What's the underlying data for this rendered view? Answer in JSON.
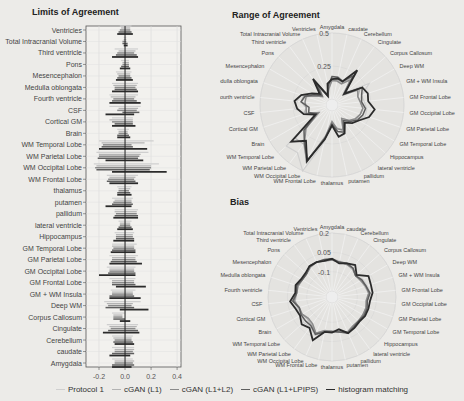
{
  "titles": {
    "loa": "Limits of Agreement",
    "range": "Range of Agreement",
    "bias": "Bias"
  },
  "legend": [
    {
      "label": "Protocol 1",
      "color": "#cfcfcf",
      "width": 1.2
    },
    {
      "label": "cGAN (L1)",
      "color": "#b3b3b3",
      "width": 1.2
    },
    {
      "label": "cGAN (L1+L2)",
      "color": "#8a8a8a",
      "width": 1.5
    },
    {
      "label": "cGAN (L1+LPIPS)",
      "color": "#5e5e5e",
      "width": 1.5
    },
    {
      "label": "histogram matching",
      "color": "#2b2b2b",
      "width": 1.8
    }
  ],
  "chart_data": [
    {
      "type": "bar",
      "subtype": "interval",
      "title": "Limits of Agreement",
      "xlabel": "",
      "ylabel": "",
      "xlim": [
        -0.3,
        0.43
      ],
      "xticks": [
        -0.2,
        0.0,
        0.2,
        0.4
      ],
      "xtick_labels": [
        "-0.2",
        "0.0",
        "0.2",
        "0.4"
      ],
      "grid": true,
      "categories": [
        "Ventricles",
        "Total Intracranial Volume",
        "Third ventricle",
        "Pons",
        "Mesencephalon",
        "Medulla oblongata",
        "Fourth ventricle",
        "CSF",
        "Cortical GM",
        "Brain",
        "WM Temporal Lobe",
        "WM Parietal Lobe",
        "WM Occipital Lobe",
        "WM Frontal Lobe",
        "thalamus",
        "putamen",
        "pallidum",
        "lateral ventricle",
        "Hippocampus",
        "GM Temporal Lobe",
        "GM Parietal Lobe",
        "GM Occipital Lobe",
        "GM Frontal Lobe",
        "GM + WM Insula",
        "Deep WM",
        "Corpus Callosum",
        "Cingulate",
        "Cerebellum",
        "caudate",
        "Amygdala"
      ],
      "series": [
        {
          "name": "Protocol 1",
          "lower": [
            -0.04,
            -0.01,
            -0.08,
            -0.03,
            -0.07,
            -0.1,
            -0.12,
            -0.12,
            -0.1,
            -0.06,
            -0.2,
            -0.22,
            -0.24,
            -0.14,
            -0.06,
            -0.1,
            -0.08,
            -0.05,
            -0.08,
            -0.1,
            -0.12,
            -0.14,
            -0.12,
            -0.11,
            -0.16,
            -0.1,
            -0.14,
            -0.1,
            -0.1,
            -0.1
          ],
          "upper": [
            0.05,
            0.01,
            0.1,
            0.03,
            0.05,
            0.1,
            0.1,
            0.12,
            0.06,
            0.03,
            0.22,
            0.18,
            0.26,
            0.1,
            0.05,
            0.06,
            0.1,
            0.05,
            0.07,
            0.09,
            0.1,
            0.08,
            0.08,
            0.08,
            0.12,
            0.0,
            0.1,
            0.06,
            0.07,
            0.06
          ]
        },
        {
          "name": "cGAN (L1)",
          "lower": [
            -0.03,
            -0.01,
            -0.05,
            -0.02,
            -0.06,
            -0.09,
            -0.11,
            -0.05,
            -0.12,
            -0.05,
            -0.18,
            -0.2,
            -0.22,
            -0.12,
            -0.05,
            -0.08,
            -0.08,
            -0.04,
            -0.07,
            -0.1,
            -0.1,
            -0.12,
            -0.1,
            -0.1,
            -0.14,
            -0.09,
            -0.12,
            -0.09,
            -0.08,
            -0.08
          ],
          "upper": [
            0.04,
            0.01,
            0.08,
            0.03,
            0.04,
            0.09,
            0.08,
            0.1,
            0.06,
            0.02,
            0.15,
            0.12,
            0.2,
            0.08,
            0.04,
            0.05,
            0.09,
            0.04,
            0.06,
            0.07,
            0.08,
            0.07,
            0.07,
            0.06,
            0.06,
            -0.02,
            0.09,
            0.05,
            0.07,
            0.07
          ]
        },
        {
          "name": "cGAN (L1+L2)",
          "lower": [
            -0.04,
            -0.02,
            -0.06,
            -0.02,
            -0.05,
            -0.08,
            -0.09,
            -0.06,
            -0.1,
            -0.05,
            -0.17,
            -0.2,
            -0.23,
            -0.13,
            -0.05,
            -0.09,
            -0.07,
            -0.04,
            -0.07,
            -0.09,
            -0.1,
            -0.12,
            -0.1,
            -0.1,
            -0.13,
            -0.09,
            -0.11,
            -0.08,
            -0.08,
            -0.08
          ],
          "upper": [
            0.04,
            0.01,
            0.07,
            0.03,
            0.04,
            0.08,
            0.07,
            0.09,
            0.06,
            0.02,
            0.05,
            0.11,
            0.2,
            0.07,
            0.03,
            0.05,
            0.09,
            0.04,
            0.06,
            0.07,
            0.08,
            0.07,
            0.07,
            0.06,
            0.05,
            -0.02,
            0.08,
            0.05,
            0.06,
            0.06
          ]
        },
        {
          "name": "cGAN (L1+LPIPS)",
          "lower": [
            -0.05,
            -0.02,
            -0.07,
            -0.03,
            -0.06,
            -0.08,
            -0.1,
            -0.02,
            -0.08,
            -0.06,
            -0.18,
            -0.21,
            -0.22,
            -0.14,
            -0.06,
            -0.1,
            -0.08,
            -0.05,
            -0.07,
            -0.1,
            -0.11,
            -0.13,
            -0.1,
            -0.12,
            -0.15,
            -0.09,
            -0.13,
            -0.09,
            -0.1,
            -0.1
          ],
          "upper": [
            0.05,
            0.02,
            0.09,
            0.03,
            0.05,
            0.09,
            0.09,
            0.11,
            0.06,
            0.03,
            0.06,
            0.1,
            0.19,
            0.08,
            0.04,
            0.06,
            0.1,
            0.05,
            0.07,
            0.08,
            0.09,
            0.08,
            0.08,
            0.07,
            0.07,
            0.0,
            0.1,
            0.06,
            0.07,
            0.07
          ]
        },
        {
          "name": "histogram matching",
          "lower": [
            -0.06,
            -0.01,
            -0.1,
            -0.04,
            -0.07,
            -0.1,
            -0.12,
            -0.15,
            -0.1,
            -0.06,
            -0.2,
            -0.15,
            -0.1,
            -0.12,
            -0.06,
            -0.15,
            -0.09,
            -0.06,
            -0.09,
            -0.11,
            -0.12,
            -0.2,
            -0.07,
            -0.12,
            -0.04,
            -0.04,
            -0.17,
            -0.08,
            -0.12,
            -0.1
          ],
          "upper": [
            0.06,
            0.02,
            0.1,
            0.04,
            0.06,
            0.1,
            0.12,
            0.07,
            0.08,
            0.04,
            0.17,
            0.14,
            0.32,
            0.1,
            0.05,
            0.05,
            0.1,
            0.06,
            0.07,
            0.08,
            0.13,
            0.08,
            0.16,
            0.12,
            0.18,
            0.04,
            0.11,
            0.07,
            0.04,
            0.05
          ]
        }
      ]
    },
    {
      "type": "radar",
      "title": "Range of Agreement",
      "radial_ticks": [
        0.25,
        0.5
      ],
      "radial_tick_labels": [
        "0.25",
        "0.5"
      ],
      "rmax": 0.5,
      "categories": [
        "Amygdala",
        "caudate",
        "Cerebellum",
        "Cingulate",
        "Corpus Callosum",
        "Deep WM",
        "GM + WM Insula",
        "GM Frontal Lobe",
        "GM Occipital Lobe",
        "GM Parietal Lobe",
        "GM Temporal Lobe",
        "Hippocampus",
        "lateral ventricle",
        "pallidum",
        "putamen",
        "thalamus",
        "WM Frontal Lobe",
        "WM Occipital Lobe",
        "WM Parietal Lobe",
        "WM Temporal Lobe",
        "Brain",
        "Cortical GM",
        "CSF",
        "Fourth ventricle",
        "Medulla oblongata",
        "Mesencephalon",
        "Pons",
        "Third ventricle",
        "Total Intracranial Volume",
        "Ventricles"
      ],
      "series": [
        {
          "name": "Protocol 1",
          "values": [
            0.16,
            0.17,
            0.16,
            0.24,
            0.1,
            0.28,
            0.19,
            0.2,
            0.22,
            0.22,
            0.19,
            0.15,
            0.1,
            0.18,
            0.16,
            0.11,
            0.24,
            0.5,
            0.4,
            0.42,
            0.09,
            0.16,
            0.24,
            0.22,
            0.2,
            0.12,
            0.06,
            0.18,
            0.02,
            0.09
          ]
        },
        {
          "name": "cGAN (L1)",
          "values": [
            0.15,
            0.15,
            0.14,
            0.21,
            0.07,
            0.2,
            0.16,
            0.17,
            0.19,
            0.18,
            0.17,
            0.13,
            0.08,
            0.17,
            0.13,
            0.09,
            0.2,
            0.42,
            0.32,
            0.33,
            0.07,
            0.18,
            0.15,
            0.19,
            0.18,
            0.1,
            0.05,
            0.13,
            0.02,
            0.07
          ]
        },
        {
          "name": "cGAN (L1+L2)",
          "values": [
            0.14,
            0.14,
            0.13,
            0.19,
            0.07,
            0.18,
            0.16,
            0.17,
            0.19,
            0.18,
            0.16,
            0.13,
            0.08,
            0.16,
            0.14,
            0.08,
            0.2,
            0.43,
            0.31,
            0.22,
            0.07,
            0.16,
            0.15,
            0.16,
            0.16,
            0.09,
            0.05,
            0.13,
            0.03,
            0.08
          ]
        },
        {
          "name": "cGAN (L1+LPIPS)",
          "values": [
            0.17,
            0.17,
            0.15,
            0.23,
            0.09,
            0.22,
            0.19,
            0.18,
            0.21,
            0.2,
            0.18,
            0.14,
            0.1,
            0.18,
            0.16,
            0.1,
            0.22,
            0.41,
            0.31,
            0.24,
            0.09,
            0.14,
            0.13,
            0.19,
            0.17,
            0.11,
            0.06,
            0.16,
            0.04,
            0.1
          ]
        },
        {
          "name": "histogram matching",
          "values": [
            0.15,
            0.16,
            0.15,
            0.28,
            0.08,
            0.22,
            0.24,
            0.23,
            0.28,
            0.25,
            0.19,
            0.16,
            0.12,
            0.19,
            0.2,
            0.11,
            0.22,
            0.42,
            0.29,
            0.37,
            0.1,
            0.18,
            0.22,
            0.24,
            0.2,
            0.13,
            0.08,
            0.2,
            0.03,
            0.12
          ]
        }
      ]
    },
    {
      "type": "radar",
      "title": "Bias",
      "radial_ticks": [
        -0.1,
        0.05,
        0.2
      ],
      "radial_tick_labels": [
        "-0.1",
        "0.05",
        "0.2"
      ],
      "rmin": -0.25,
      "rmax": 0.2,
      "categories": [
        "Amygdala",
        "caudate",
        "Cerebellum",
        "Cingulate",
        "Corpus Callosum",
        "Deep WM",
        "GM + WM Insula",
        "GM Frontal Lobe",
        "GM Occipital Lobe",
        "GM Parietal Lobe",
        "GM Temporal Lobe",
        "Hippocampus",
        "lateral ventricle",
        "pallidum",
        "putamen",
        "thalamus",
        "WM Frontal Lobe",
        "WM Occipital Lobe",
        "WM Parietal Lobe",
        "WM Temporal Lobe",
        "Brain",
        "Cortical GM",
        "CSF",
        "Fourth ventricle",
        "Medulla oblongata",
        "Mesencephalon",
        "Pons",
        "Third ventricle",
        "Total Intracranial Volume",
        "Ventricles"
      ],
      "series": [
        {
          "name": "Protocol 1",
          "values": [
            0.0,
            -0.01,
            -0.02,
            -0.02,
            -0.05,
            -0.02,
            -0.01,
            0.0,
            -0.03,
            -0.01,
            -0.01,
            -0.02,
            -0.01,
            0.01,
            -0.02,
            -0.03,
            -0.02,
            0.03,
            -0.01,
            0.0,
            -0.02,
            -0.01,
            0.0,
            -0.02,
            0.0,
            -0.03,
            -0.03,
            0.0,
            0.0,
            0.0
          ]
        },
        {
          "name": "cGAN (L1)",
          "values": [
            -0.01,
            -0.02,
            -0.02,
            -0.03,
            -0.05,
            -0.04,
            -0.03,
            -0.01,
            -0.02,
            -0.02,
            -0.02,
            -0.02,
            -0.01,
            0.0,
            -0.03,
            -0.03,
            -0.03,
            0.01,
            -0.03,
            -0.04,
            -0.03,
            -0.02,
            -0.01,
            -0.02,
            -0.01,
            -0.03,
            -0.03,
            -0.01,
            0.0,
            -0.01
          ]
        },
        {
          "name": "cGAN (L1+L2)",
          "values": [
            -0.01,
            -0.02,
            -0.02,
            -0.02,
            -0.05,
            -0.04,
            -0.02,
            -0.01,
            -0.03,
            -0.02,
            -0.02,
            -0.02,
            -0.02,
            0.0,
            -0.02,
            -0.03,
            -0.03,
            0.01,
            -0.04,
            -0.05,
            -0.03,
            -0.03,
            0.0,
            -0.02,
            -0.02,
            -0.03,
            -0.03,
            -0.01,
            0.0,
            -0.01
          ]
        },
        {
          "name": "cGAN (L1+LPIPS)",
          "values": [
            0.0,
            -0.02,
            -0.01,
            -0.02,
            -0.05,
            -0.03,
            -0.02,
            0.0,
            -0.02,
            -0.01,
            -0.01,
            -0.02,
            -0.01,
            0.01,
            -0.02,
            -0.03,
            -0.02,
            0.02,
            -0.02,
            -0.02,
            -0.02,
            -0.03,
            0.01,
            -0.02,
            -0.01,
            -0.03,
            -0.03,
            0.0,
            0.0,
            0.0
          ]
        },
        {
          "name": "histogram matching",
          "values": [
            0.0,
            -0.03,
            -0.01,
            0.01,
            -0.04,
            0.03,
            0.02,
            0.02,
            0.0,
            0.0,
            0.0,
            -0.01,
            0.0,
            0.01,
            -0.04,
            -0.02,
            -0.02,
            0.07,
            0.0,
            0.02,
            -0.01,
            0.0,
            0.03,
            -0.01,
            0.0,
            -0.02,
            -0.02,
            0.0,
            0.0,
            -0.01
          ]
        }
      ]
    }
  ]
}
